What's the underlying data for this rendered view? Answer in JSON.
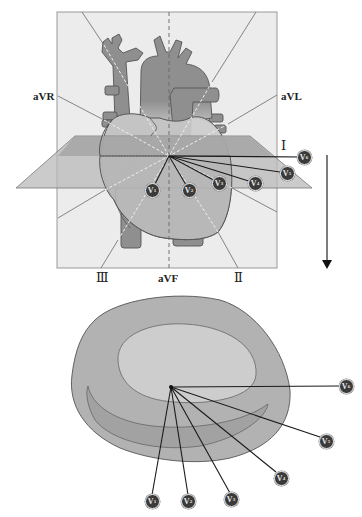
{
  "figure": {
    "type": "ECG lead placement diagram",
    "frontal_view": {
      "limb_lead_labels": {
        "aVR": "aVR",
        "aVL": "aVL",
        "I": "Ⅰ",
        "III": "Ⅲ",
        "aVF": "aVF",
        "II": "Ⅱ"
      },
      "precordial_electrodes": [
        {
          "id": "V1",
          "letter": "V",
          "sub": "1",
          "x": 152,
          "y": 190
        },
        {
          "id": "V2",
          "letter": "V",
          "sub": "2",
          "x": 189,
          "y": 190
        },
        {
          "id": "V3",
          "letter": "V",
          "sub": "3",
          "x": 219,
          "y": 183
        },
        {
          "id": "V4",
          "letter": "V",
          "sub": "4",
          "x": 255,
          "y": 183
        },
        {
          "id": "V5",
          "letter": "V",
          "sub": "5",
          "x": 287,
          "y": 173
        },
        {
          "id": "V6",
          "letter": "V",
          "sub": "6",
          "x": 304,
          "y": 157
        }
      ],
      "center": {
        "x": 169,
        "y": 156
      }
    },
    "arrow": {
      "direction": "down"
    },
    "transverse_view": {
      "precordial_electrodes": [
        {
          "id": "V1",
          "letter": "V",
          "sub": "1",
          "x": 152,
          "y": 501
        },
        {
          "id": "V2",
          "letter": "V",
          "sub": "2",
          "x": 188,
          "y": 501
        },
        {
          "id": "V3",
          "letter": "V",
          "sub": "3",
          "x": 231,
          "y": 499
        },
        {
          "id": "V4",
          "letter": "V",
          "sub": "4",
          "x": 281,
          "y": 478
        },
        {
          "id": "V5",
          "letter": "V",
          "sub": "5",
          "x": 326,
          "y": 441
        },
        {
          "id": "V6",
          "letter": "V",
          "sub": "6",
          "x": 346,
          "y": 386
        }
      ],
      "center": {
        "x": 171,
        "y": 387
      }
    },
    "colors": {
      "background_panel": "#ececec",
      "vessel": "#8f8f8f",
      "heart_light": "#c4c4c4",
      "heart_mid": "#aaaaaa",
      "plane_top": "#a3a3a3",
      "plane_bottom": "#b9b9b9",
      "outline": "#555555",
      "electrode": "#3a3a3a",
      "lead_line": "#1a1a1a",
      "blob_outer": "#b2b2b2",
      "blob_inner": "#cdcdcd",
      "crescent": "#a2a2a2"
    }
  }
}
